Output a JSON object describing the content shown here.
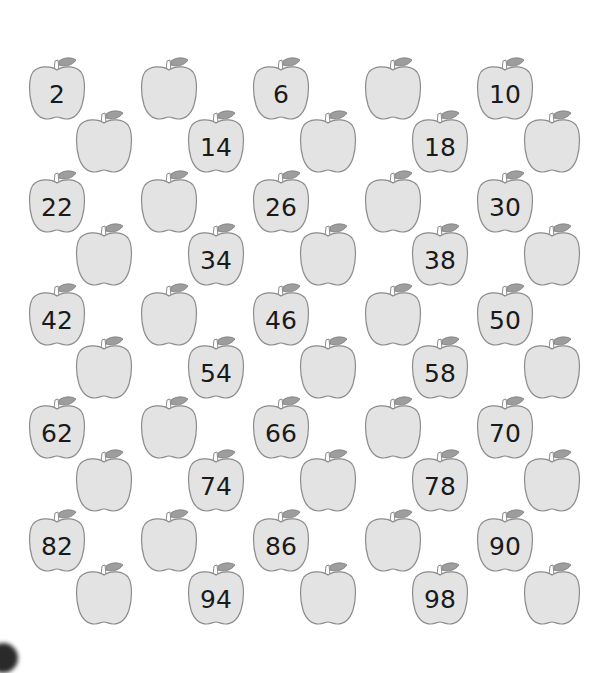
{
  "worksheet": {
    "title": "",
    "colors": {
      "apple_fill": "#e3e3e3",
      "apple_stroke": "#8c8c8c",
      "leaf_fill": "#9d9d9d",
      "number_color": "#1a1a1a"
    },
    "grid": {
      "columns": 10,
      "rows": 10,
      "note": "Even numbers 2-100; top-row apples show 2,6,10,... and offset apples show 14,18,34,..."
    },
    "apples": [
      {
        "n": 2,
        "label": "2",
        "x": 28,
        "y": 57
      },
      {
        "n": 4,
        "label": "",
        "x": 75,
        "y": 110
      },
      {
        "n": 6,
        "label": "",
        "x": 140,
        "y": 57
      },
      {
        "n": 8,
        "label": "14",
        "x": 187,
        "y": 110
      },
      {
        "n": 10,
        "label": "6",
        "x": 252,
        "y": 57
      },
      {
        "n": 12,
        "label": "",
        "x": 299,
        "y": 110
      },
      {
        "n": 14,
        "label": "",
        "x": 364,
        "y": 57
      },
      {
        "n": 16,
        "label": "18",
        "x": 411,
        "y": 110
      },
      {
        "n": 18,
        "label": "10",
        "x": 476,
        "y": 57
      },
      {
        "n": 20,
        "label": "",
        "x": 523,
        "y": 110
      },
      {
        "n": 22,
        "label": "22",
        "x": 28,
        "y": 170
      },
      {
        "n": 24,
        "label": "",
        "x": 75,
        "y": 223
      },
      {
        "n": 26,
        "label": "",
        "x": 140,
        "y": 170
      },
      {
        "n": 28,
        "label": "34",
        "x": 187,
        "y": 223
      },
      {
        "n": 30,
        "label": "26",
        "x": 252,
        "y": 170
      },
      {
        "n": 32,
        "label": "",
        "x": 299,
        "y": 223
      },
      {
        "n": 34,
        "label": "",
        "x": 364,
        "y": 170
      },
      {
        "n": 36,
        "label": "38",
        "x": 411,
        "y": 223
      },
      {
        "n": 38,
        "label": "30",
        "x": 476,
        "y": 170
      },
      {
        "n": 40,
        "label": "",
        "x": 523,
        "y": 223
      },
      {
        "n": 42,
        "label": "42",
        "x": 28,
        "y": 283
      },
      {
        "n": 44,
        "label": "",
        "x": 75,
        "y": 336
      },
      {
        "n": 46,
        "label": "",
        "x": 140,
        "y": 283
      },
      {
        "n": 48,
        "label": "54",
        "x": 187,
        "y": 336
      },
      {
        "n": 50,
        "label": "46",
        "x": 252,
        "y": 283
      },
      {
        "n": 52,
        "label": "",
        "x": 299,
        "y": 336
      },
      {
        "n": 54,
        "label": "",
        "x": 364,
        "y": 283
      },
      {
        "n": 56,
        "label": "58",
        "x": 411,
        "y": 336
      },
      {
        "n": 58,
        "label": "50",
        "x": 476,
        "y": 283
      },
      {
        "n": 60,
        "label": "",
        "x": 523,
        "y": 336
      },
      {
        "n": 62,
        "label": "62",
        "x": 28,
        "y": 396
      },
      {
        "n": 64,
        "label": "",
        "x": 75,
        "y": 449
      },
      {
        "n": 66,
        "label": "",
        "x": 140,
        "y": 396
      },
      {
        "n": 68,
        "label": "74",
        "x": 187,
        "y": 449
      },
      {
        "n": 70,
        "label": "66",
        "x": 252,
        "y": 396
      },
      {
        "n": 72,
        "label": "",
        "x": 299,
        "y": 449
      },
      {
        "n": 74,
        "label": "",
        "x": 364,
        "y": 396
      },
      {
        "n": 76,
        "label": "78",
        "x": 411,
        "y": 449
      },
      {
        "n": 78,
        "label": "70",
        "x": 476,
        "y": 396
      },
      {
        "n": 80,
        "label": "",
        "x": 523,
        "y": 449
      },
      {
        "n": 82,
        "label": "82",
        "x": 28,
        "y": 509
      },
      {
        "n": 84,
        "label": "",
        "x": 75,
        "y": 562
      },
      {
        "n": 86,
        "label": "",
        "x": 140,
        "y": 509
      },
      {
        "n": 88,
        "label": "94",
        "x": 187,
        "y": 562
      },
      {
        "n": 90,
        "label": "86",
        "x": 252,
        "y": 509
      },
      {
        "n": 92,
        "label": "",
        "x": 299,
        "y": 562
      },
      {
        "n": 94,
        "label": "",
        "x": 364,
        "y": 509
      },
      {
        "n": 96,
        "label": "98",
        "x": 411,
        "y": 562
      },
      {
        "n": 98,
        "label": "90",
        "x": 476,
        "y": 509
      },
      {
        "n": 100,
        "label": "",
        "x": 523,
        "y": 562
      }
    ]
  }
}
